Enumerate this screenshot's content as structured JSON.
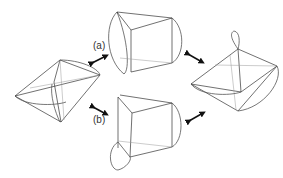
{
  "diagram": {
    "labels": {
      "a": "(a)",
      "b": "(b)"
    },
    "shapes": [
      {
        "id": "top",
        "description": "truncated-cone frustum with side loop"
      },
      {
        "id": "left",
        "description": "bipyramid with curved edge"
      },
      {
        "id": "right",
        "description": "bipyramid with loop"
      },
      {
        "id": "bottom",
        "description": "frustum with bottom loop"
      }
    ],
    "arrows": [
      {
        "id": "a",
        "direction": "double"
      },
      {
        "id": "top-right",
        "direction": "double"
      },
      {
        "id": "b",
        "direction": "double"
      },
      {
        "id": "bottom-right",
        "direction": "double"
      }
    ],
    "colors": {
      "line": "#333333",
      "hidden_line": "#999999",
      "background": "#ffffff"
    }
  }
}
